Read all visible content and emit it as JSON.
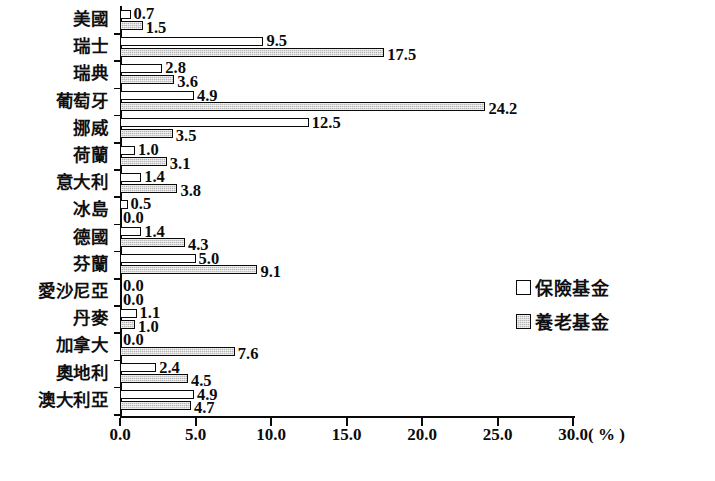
{
  "chart_data": {
    "type": "bar",
    "orientation": "horizontal",
    "title": "",
    "xlabel": "( % )",
    "ylabel": "",
    "xlim": [
      0,
      30
    ],
    "xticks": [
      "0.0",
      "5.0",
      "10.0",
      "15.0",
      "20.0",
      "25.0",
      "30.0"
    ],
    "grid": false,
    "legend_position": "right",
    "categories": [
      "美國",
      "瑞士",
      "瑞典",
      "葡萄牙",
      "挪威",
      "荷蘭",
      "意大利",
      "冰島",
      "德國",
      "芬蘭",
      "愛沙尼亞",
      "丹麥",
      "加拿大",
      "奧地利",
      "澳大利亞"
    ],
    "series": [
      {
        "name": "保險基金",
        "style": "hollow",
        "values": [
          0.7,
          9.5,
          2.8,
          4.9,
          12.5,
          1.0,
          1.4,
          0.5,
          1.4,
          5.0,
          0.0,
          1.1,
          0.0,
          2.4,
          4.9
        ],
        "labels": [
          "0.7",
          "9.5",
          "2.8",
          "4.9",
          "12.5",
          "1.0",
          "1.4",
          "0.5",
          "1.4",
          "5.0",
          "0.0",
          "1.1",
          "0.0",
          "2.4",
          "4.9"
        ]
      },
      {
        "name": "養老基金",
        "style": "gray-hatched",
        "values": [
          1.5,
          17.5,
          3.6,
          24.2,
          3.5,
          3.1,
          3.8,
          0.0,
          4.3,
          9.1,
          0.0,
          1.0,
          7.6,
          4.5,
          4.7
        ],
        "labels": [
          "1.5",
          "17.5",
          "3.6",
          "24.2",
          "3.5",
          "3.1",
          "3.8",
          "0.0",
          "4.3",
          "9.1",
          "0.0",
          "1.0",
          "7.6",
          "4.5",
          "4.7"
        ]
      }
    ]
  },
  "legend": {
    "items": [
      {
        "label": "保險基金",
        "style": "hollow"
      },
      {
        "label": "養老基金",
        "style": "filled"
      }
    ]
  },
  "axis": {
    "unit_label": "( % )"
  },
  "colors": {
    "axis": "#0a0a0a",
    "series_1_fill": "#ffffff",
    "series_2_fill": "#b6b6b6",
    "text": "#0b0b0b"
  }
}
